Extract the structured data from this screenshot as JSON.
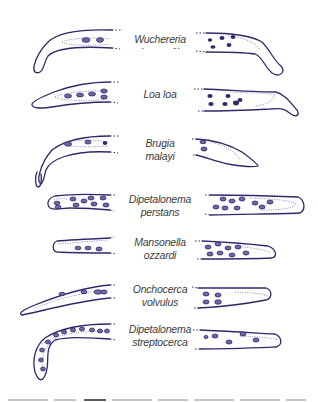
{
  "figure": {
    "colors": {
      "outline": "#2e2a6b",
      "inner": "#7a70b0",
      "nucleus": "#3a3478",
      "nucleus_fill": "#6f68a8",
      "label": "#3c3c3c"
    },
    "species": [
      {
        "id": "wuchereria-bancrofti",
        "label_lines": [
          "Wuchereria bancrofti"
        ]
      },
      {
        "id": "loa-loa",
        "label_lines": [
          "Loa loa"
        ]
      },
      {
        "id": "brugia-malayi",
        "label_lines": [
          "Brugia",
          "malayi"
        ]
      },
      {
        "id": "dipetalonema-perstans",
        "label_lines": [
          "Dipetalonema",
          "perstans"
        ]
      },
      {
        "id": "mansonella-ozzardi",
        "label_lines": [
          "Mansonella",
          "ozzardi"
        ]
      },
      {
        "id": "onchocerca-volvulus",
        "label_lines": [
          "Onchocerca",
          "volvulus"
        ]
      },
      {
        "id": "dipetalonema-streptocerca",
        "label_lines": [
          "Dipetalonema",
          "streptocerca"
        ]
      }
    ],
    "caption_visible": false
  }
}
